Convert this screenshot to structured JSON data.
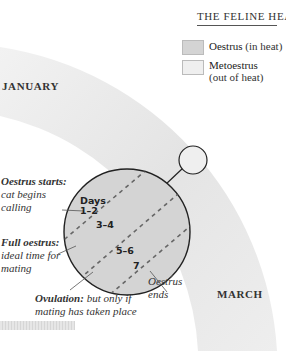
{
  "title": "THE FELINE HEAT CYCLE",
  "legend": [
    {
      "label_bold": "Oestrus",
      "label_rest": " (in heat)",
      "color": "#d4d4d4"
    },
    {
      "label_bold": "Metoestrus",
      "label_rest": "(out of heat)",
      "color": "#efefef"
    }
  ],
  "months": {
    "january": "JANUARY",
    "march": "MARCH"
  },
  "days": {
    "header": "Days",
    "d12": "1–2",
    "d34": "3–4",
    "d56": "5–6",
    "d7": "7"
  },
  "annotations": {
    "oestrus_starts": {
      "bold": "Oestrus starts:",
      "line1": "cat begins",
      "line2": "calling"
    },
    "full_oestrus": {
      "bold": "Full oestrus:",
      "line1": "ideal time for",
      "line2": "mating"
    },
    "ovulation": {
      "bold": "Ovulation:",
      "rest": " but only if",
      "line2": "mating has taken place"
    },
    "oestrus_ends": {
      "line1": "Oestrus",
      "line2": "ends"
    }
  },
  "colors": {
    "band": "#ececec",
    "oestrus_circle": "#d4d4d4",
    "outline": "#222222"
  }
}
